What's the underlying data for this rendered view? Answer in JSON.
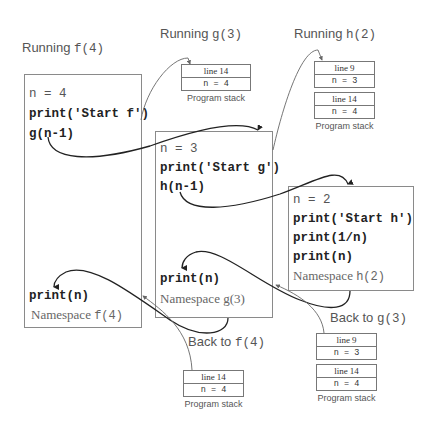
{
  "headings": {
    "running_f": {
      "prefix": "Running ",
      "call": "f(4)"
    },
    "running_g": {
      "prefix": "Running ",
      "call": "g(3)"
    },
    "running_h": {
      "prefix": "Running ",
      "call": "h(2)"
    },
    "back_to_f": {
      "prefix": "Back to ",
      "call": "f(4)"
    },
    "back_to_g": {
      "prefix": "Back to ",
      "call": "g(3)"
    }
  },
  "namespaces": {
    "f": {
      "lines": [
        "n = 4",
        "print('Start f')",
        "g(n-1)"
      ],
      "tail": "print(n)",
      "label_prefix": "Namespace ",
      "label_call": "f(4)"
    },
    "g": {
      "lines": [
        "n = 3",
        "print('Start g')",
        "h(n-1)"
      ],
      "tail": "print(n)",
      "label": "Namespace g(3)"
    },
    "h": {
      "lines": [
        "n = 2",
        "print('Start h')",
        "print(1/n)",
        "print(n)"
      ],
      "label_prefix": "Namespace ",
      "label_call": "h(2)"
    }
  },
  "stacks": {
    "running_g": {
      "frames": [
        {
          "line": "line 14",
          "var": "n = 4"
        }
      ],
      "label": "Program stack"
    },
    "running_h": {
      "frames": [
        {
          "line": "line 9",
          "var": "n = 3"
        },
        {
          "line": "line 14",
          "var": "n = 4"
        }
      ],
      "label": "Program stack"
    },
    "back_to_f": {
      "frames": [
        {
          "line": "line 14",
          "var": "n = 4"
        }
      ],
      "label": "Program stack"
    },
    "back_to_g": {
      "frames": [
        {
          "line": "line 9",
          "var": "n = 3"
        },
        {
          "line": "line 14",
          "var": "n = 4"
        }
      ],
      "label": "Program stack"
    }
  },
  "colors": {
    "border": "#8a8a8a",
    "arrow": "#222222",
    "thin_arrow": "#666666",
    "label_text": "#555555"
  }
}
